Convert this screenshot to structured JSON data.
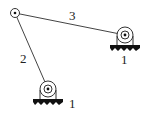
{
  "diagram": {
    "type": "four-bar linkage schematic",
    "links": [
      {
        "id": "2",
        "label": "2",
        "from": "support_left",
        "to": "joint_top"
      },
      {
        "id": "3",
        "label": "3",
        "from": "joint_top",
        "to": "support_right"
      }
    ],
    "supports": [
      {
        "id": "support_right",
        "label": "1"
      },
      {
        "id": "support_left",
        "label": "1"
      }
    ],
    "joints": [
      {
        "id": "joint_top"
      }
    ],
    "colors": {
      "line": "#333333",
      "ground": "#111111"
    }
  }
}
